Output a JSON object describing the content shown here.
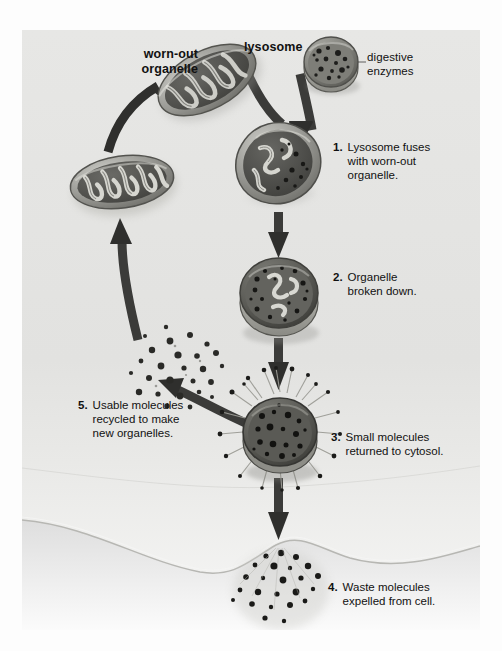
{
  "figure": {
    "background_color": "#e6e6e4",
    "ink_color": "#111111",
    "organelle_fill": "#8f8f8b",
    "organelle_dark": "#4a4a47",
    "arrow_color": "#3b3b39"
  },
  "labels": {
    "worn_out_organelle": "worn-out\norganelle",
    "lysosome": "lysosome",
    "digestive_enzymes": "digestive\nenzymes"
  },
  "steps": [
    {
      "number": "1.",
      "text": "Lysosome fuses\nwith worn-out\norganelle."
    },
    {
      "number": "2.",
      "text": "Organelle\nbroken down."
    },
    {
      "number": "3.",
      "text": "Small molecules\nreturned to cytosol."
    },
    {
      "number": "4.",
      "text": "Waste molecules\nexpelled from cell."
    },
    {
      "number": "5.",
      "text": "Usable molecules\nrecycled to make\nnew organelles."
    }
  ],
  "diagram_elements": [
    {
      "name": "worn-out-mitochondrion",
      "kind": "mitochondrion"
    },
    {
      "name": "lysosome-vesicle",
      "kind": "lysosome"
    },
    {
      "name": "fused-vesicle",
      "kind": "autophagosome"
    },
    {
      "name": "digested-vesicle",
      "kind": "residual-body"
    },
    {
      "name": "molecule-releasing-vesicle",
      "kind": "vesicle-with-molecules"
    },
    {
      "name": "new-mitochondrion",
      "kind": "mitochondrion"
    },
    {
      "name": "recycled-molecule-cloud",
      "kind": "molecules"
    },
    {
      "name": "expelled-waste-molecules",
      "kind": "molecules"
    },
    {
      "name": "cell-membrane",
      "kind": "membrane"
    }
  ]
}
